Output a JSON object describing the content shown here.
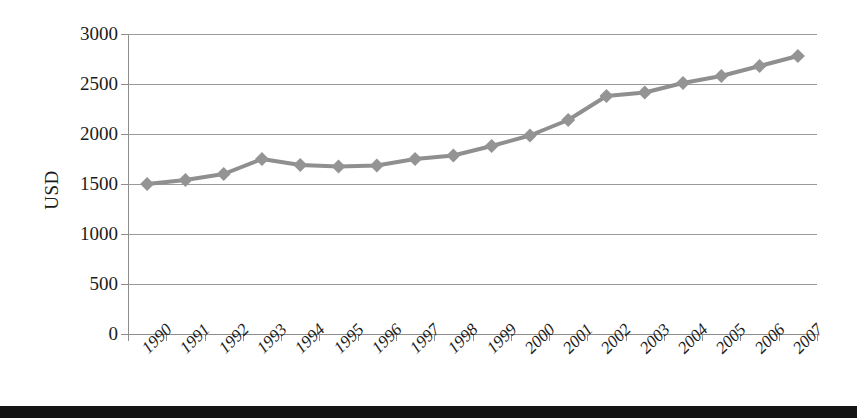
{
  "chart_data": {
    "type": "line",
    "title": "",
    "subtitle": "",
    "xlabel": "",
    "ylabel": "USD",
    "categories": [
      "1990",
      "1991",
      "1992",
      "1993",
      "1994",
      "1995",
      "1996",
      "1997",
      "1998",
      "1999",
      "2000",
      "2001",
      "2002",
      "2003",
      "2004",
      "2005",
      "2006",
      "2007"
    ],
    "series": [
      {
        "name": "USD",
        "values": [
          1500,
          1540,
          1600,
          1750,
          1690,
          1675,
          1685,
          1750,
          1785,
          1880,
          1985,
          2140,
          2380,
          2415,
          2510,
          2580,
          2680,
          2780
        ]
      }
    ],
    "ylim": [
      0,
      3000
    ],
    "yticks": [
      0,
      500,
      1000,
      1500,
      2000,
      2500,
      3000
    ],
    "ytick_labels": [
      "0",
      "500",
      "1000",
      "1500",
      "2000",
      "2500",
      "3000"
    ],
    "grid": true,
    "legend": "none",
    "marker": "diamond",
    "line_color": "#8f8f8f",
    "marker_color": "#949494",
    "grid_color": "#9a9a9a",
    "axis_color": "#8d8d8d",
    "text_color": "#1b1b1b",
    "background": "#ffffff"
  },
  "page": {
    "bottom_bar_color": "#141414"
  }
}
